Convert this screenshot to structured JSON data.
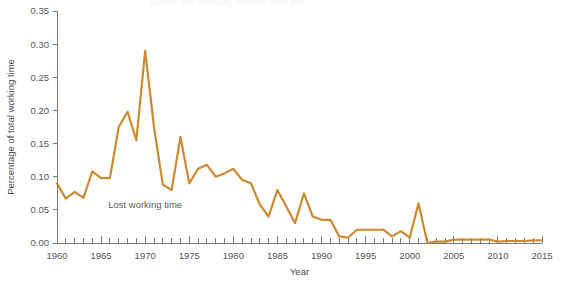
{
  "figure": {
    "background_color": "#ffffff",
    "cropped_header_text": "Strikes and lockouts, working days lost"
  },
  "chart_data": {
    "type": "line",
    "title": "",
    "subtitle": "",
    "xlabel": "Year",
    "ylabel": "Percentage of total working time",
    "xlim": [
      1960,
      2015
    ],
    "ylim": [
      0.0,
      0.35
    ],
    "xticks": [
      1960,
      1965,
      1970,
      1975,
      1980,
      1985,
      1990,
      1995,
      2000,
      2005,
      2010,
      2015
    ],
    "xtick_labels": [
      "1960",
      "1965",
      "1970",
      "1975",
      "1980",
      "1985",
      "1990",
      "1995",
      "2000",
      "2005",
      "2010",
      "2015"
    ],
    "minor_xtick_step": 1,
    "yticks": [
      0.0,
      0.05,
      0.1,
      0.15,
      0.2,
      0.25,
      0.3,
      0.35
    ],
    "ytick_labels": [
      "0.00",
      "0.05",
      "0.10",
      "0.15",
      "0.20",
      "0.25",
      "0.30",
      "0.35"
    ],
    "grid": false,
    "legend": null,
    "legend_position": "none",
    "annotations": [
      {
        "text": "Lost working time",
        "x": 1970.0,
        "y": 0.053,
        "color": "#5a5a5a"
      }
    ],
    "series": [
      {
        "name": "Lost working time",
        "color": "#cc8b33",
        "line_width": 2.2,
        "x": [
          1960,
          1961,
          1962,
          1963,
          1964,
          1965,
          1966,
          1967,
          1968,
          1969,
          1970,
          1971,
          1972,
          1973,
          1974,
          1975,
          1976,
          1977,
          1978,
          1979,
          1980,
          1981,
          1982,
          1983,
          1984,
          1985,
          1986,
          1987,
          1988,
          1989,
          1990,
          1991,
          1992,
          1993,
          1994,
          1995,
          1996,
          1997,
          1998,
          1999,
          2000,
          2001,
          2002,
          2003,
          2004,
          2005,
          2006,
          2007,
          2008,
          2009,
          2010,
          2011,
          2012,
          2013,
          2014,
          2015
        ],
        "y": [
          0.09,
          0.067,
          0.077,
          0.068,
          0.108,
          0.098,
          0.098,
          0.175,
          0.198,
          0.155,
          0.29,
          0.175,
          0.088,
          0.08,
          0.16,
          0.09,
          0.112,
          0.118,
          0.1,
          0.105,
          0.112,
          0.095,
          0.09,
          0.058,
          0.04,
          0.08,
          0.055,
          0.03,
          0.075,
          0.04,
          0.035,
          0.035,
          0.01,
          0.008,
          0.02,
          0.02,
          0.02,
          0.02,
          0.01,
          0.018,
          0.008,
          0.06,
          0.0,
          0.002,
          0.002,
          0.005,
          0.005,
          0.005,
          0.005,
          0.005,
          0.002,
          0.003,
          0.003,
          0.003,
          0.004,
          0.004
        ]
      }
    ]
  }
}
